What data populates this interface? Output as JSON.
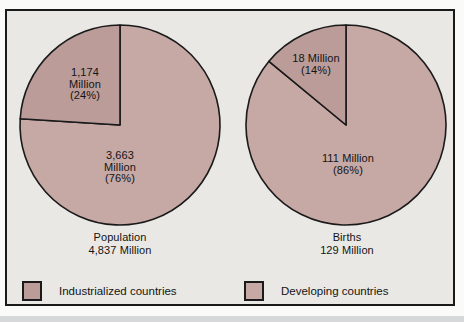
{
  "figure": {
    "panel_bg": "#e9e8e4",
    "border_color": "#1a1a1a"
  },
  "colors": {
    "industrialized": "#bb9c99",
    "developing": "#c6a8a4"
  },
  "chart_data": [
    {
      "type": "pie",
      "name": "population",
      "caption": "Population\n4,837 Million",
      "total_value": 4837,
      "units": "Million",
      "slices": [
        {
          "category": "Industrialized countries",
          "label": "1,174\nMillion\n(24%)",
          "value": 1174,
          "percent": 24,
          "color_key": "industrialized"
        },
        {
          "category": "Developing countries",
          "label": "3,663\nMillion\n(76%)",
          "value": 3663,
          "percent": 76,
          "color_key": "developing"
        }
      ],
      "layout": {
        "start": "top",
        "small_slice_direction": "counterclockwise"
      }
    },
    {
      "type": "pie",
      "name": "births",
      "caption": "Births\n129 Million",
      "total_value": 129,
      "units": "Million",
      "slices": [
        {
          "category": "Industrialized countries",
          "label": "18 Million\n(14%)",
          "value": 18,
          "percent": 14,
          "color_key": "industrialized"
        },
        {
          "category": "Developing countries",
          "label": "111 Million\n(86%)",
          "value": 111,
          "percent": 86,
          "color_key": "developing"
        }
      ],
      "layout": {
        "start": "top",
        "small_slice_direction": "counterclockwise"
      }
    }
  ],
  "legend": {
    "items": [
      {
        "label": "Industrialized countries",
        "color_key": "industrialized"
      },
      {
        "label": "Developing countries",
        "color_key": "developing"
      }
    ]
  }
}
